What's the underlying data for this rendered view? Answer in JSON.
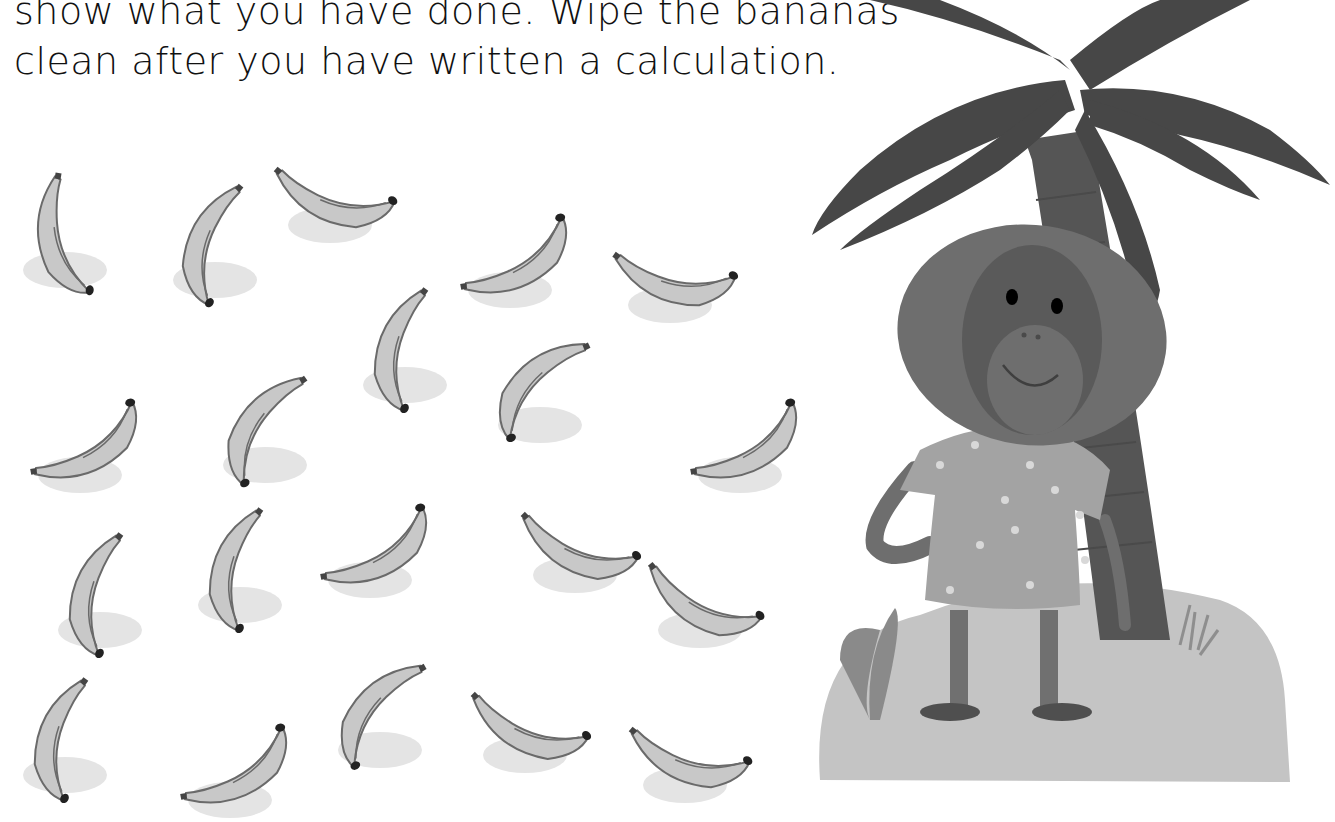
{
  "instructions": {
    "line1": "show what you have done. Wipe the bananas",
    "line2": "clean after you have written a calculation."
  },
  "bananas": {
    "count": 20,
    "items": [
      {
        "x": 5,
        "y": 60,
        "rot": 10
      },
      {
        "x": 155,
        "y": 70,
        "rot": 40
      },
      {
        "x": 270,
        "y": 15,
        "rot": -50
      },
      {
        "x": 450,
        "y": 80,
        "rot": -100
      },
      {
        "x": 610,
        "y": 95,
        "rot": -55
      },
      {
        "x": 20,
        "y": 265,
        "rot": -100
      },
      {
        "x": 205,
        "y": 255,
        "rot": 55
      },
      {
        "x": 345,
        "y": 175,
        "rot": 35
      },
      {
        "x": 480,
        "y": 215,
        "rot": 65
      },
      {
        "x": 680,
        "y": 265,
        "rot": -100
      },
      {
        "x": 40,
        "y": 420,
        "rot": 35
      },
      {
        "x": 180,
        "y": 395,
        "rot": 35
      },
      {
        "x": 310,
        "y": 370,
        "rot": -100
      },
      {
        "x": 515,
        "y": 365,
        "rot": -45
      },
      {
        "x": 640,
        "y": 420,
        "rot": -40
      },
      {
        "x": 5,
        "y": 565,
        "rot": 35
      },
      {
        "x": 170,
        "y": 590,
        "rot": -100
      },
      {
        "x": 320,
        "y": 540,
        "rot": 60
      },
      {
        "x": 465,
        "y": 545,
        "rot": -45
      },
      {
        "x": 625,
        "y": 575,
        "rot": -50
      }
    ]
  },
  "illustration": {
    "subject": "orangutan-under-palm-tree",
    "colors": {
      "palm_leaves": "#474747",
      "trunk": "#555555",
      "monkey_fur": "#6e6e6e",
      "monkey_face": "#5a5a5a",
      "shirt": "#a3a3a3",
      "ground": "#c4c4c4",
      "banana_fill": "#c8c8c8",
      "banana_outline": "#6a6a6a",
      "banana_shadow": "#e4e4e4"
    }
  }
}
